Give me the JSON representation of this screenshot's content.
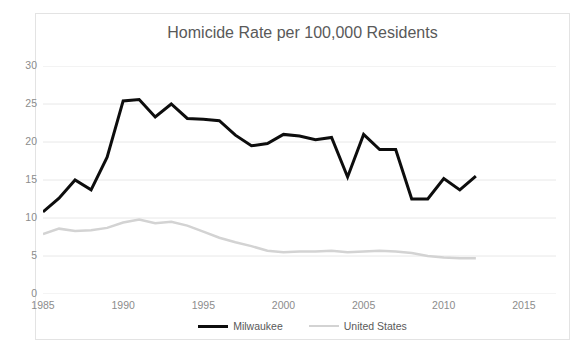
{
  "edge_artifacts": {
    "top_fragment": "",
    "bottom_fragment": ""
  },
  "chart_data": {
    "type": "line",
    "title": "Homicide Rate per 100,000 Residents",
    "xlabel": "",
    "ylabel": "",
    "xlim": [
      1985,
      2017
    ],
    "ylim": [
      0,
      30
    ],
    "yticks": [
      0,
      5,
      10,
      15,
      20,
      25,
      30
    ],
    "xticks": [
      1985,
      1990,
      1995,
      2000,
      2005,
      2010,
      2015
    ],
    "grid": true,
    "legend_position": "bottom",
    "x": [
      1985,
      1986,
      1987,
      1988,
      1989,
      1990,
      1991,
      1992,
      1993,
      1994,
      1995,
      1996,
      1997,
      1998,
      1999,
      2000,
      2001,
      2002,
      2003,
      2004,
      2005,
      2006,
      2007,
      2008,
      2009,
      2010,
      2011,
      2012
    ],
    "series": [
      {
        "name": "Milwaukee",
        "color": "#0d0d0d",
        "width": 3,
        "values": [
          10.8,
          12.6,
          15.0,
          13.7,
          18.0,
          25.4,
          25.6,
          23.3,
          25.0,
          23.1,
          23.0,
          22.8,
          20.9,
          19.5,
          19.8,
          21.0,
          20.8,
          20.3,
          20.6,
          15.4,
          21.0,
          19.0,
          19.0,
          12.5,
          12.5,
          15.2,
          13.7,
          15.5
        ]
      },
      {
        "name": "United States",
        "color": "#d3d3d3",
        "width": 2.5,
        "values": [
          7.9,
          8.6,
          8.3,
          8.4,
          8.7,
          9.4,
          9.8,
          9.3,
          9.5,
          9.0,
          8.2,
          7.4,
          6.8,
          6.3,
          5.7,
          5.5,
          5.6,
          5.6,
          5.7,
          5.5,
          5.6,
          5.7,
          5.6,
          5.4,
          5.0,
          4.8,
          4.7,
          4.7
        ]
      }
    ]
  },
  "legend": {
    "items": [
      {
        "label": "Milwaukee"
      },
      {
        "label": "United States"
      }
    ]
  }
}
